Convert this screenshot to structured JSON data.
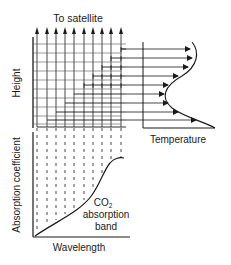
{
  "labels": {
    "top": "To satellite",
    "height_axis": "Height",
    "absorption_axis": "Absorption coefficient",
    "temperature_axis": "Temperature",
    "wavelength_axis": "Wavelength",
    "band_line1": "CO",
    "band_sub": "2",
    "band_line2": "absorption",
    "band_line3": "band"
  },
  "colors": {
    "line": "#1a1a1a",
    "grid": "#444444"
  }
}
